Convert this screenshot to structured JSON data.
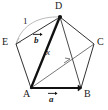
{
  "figure": {
    "type": "geometry-diagram",
    "shape": "regular-pentagon",
    "background_color": "#ffffff",
    "line_color": "#1a1a1a",
    "faint_line_color": "#9a9a9a"
  },
  "vertices": [
    {
      "name": "A",
      "label": "A",
      "x": 31,
      "y": 88,
      "label_x": 24,
      "label_y": 89
    },
    {
      "name": "B",
      "label": "B",
      "x": 81,
      "y": 88,
      "label_x": 84,
      "label_y": 89
    },
    {
      "name": "C",
      "label": "C",
      "x": 94,
      "y": 44,
      "label_x": 97,
      "label_y": 38
    },
    {
      "name": "D",
      "label": "D",
      "x": 60,
      "y": 17,
      "label_x": 56,
      "label_y": 2
    },
    {
      "name": "E",
      "label": "E",
      "x": 16,
      "y": 44,
      "label_x": 4,
      "label_y": 38
    }
  ],
  "edges": [
    {
      "from": "A",
      "to": "B",
      "style": "bold-vector"
    },
    {
      "from": "B",
      "to": "C",
      "style": "thin"
    },
    {
      "from": "C",
      "to": "D",
      "style": "thin"
    },
    {
      "from": "D",
      "to": "E",
      "style": "thin"
    },
    {
      "from": "E",
      "to": "A",
      "style": "thin"
    }
  ],
  "diagonals": [
    {
      "from": "A",
      "to": "D",
      "style": "bold-vector"
    },
    {
      "from": "A",
      "to": "C",
      "style": "thin-arrow"
    },
    {
      "from": "D",
      "to": "B",
      "style": "thin"
    },
    {
      "from": "E",
      "to": "D",
      "style": "faint-arc"
    }
  ],
  "labels": {
    "vector_a": {
      "text": "a",
      "accent": "vector-arrow",
      "x": 50,
      "y": 96
    },
    "vector_b": {
      "text": "b",
      "accent": "vector-arrow",
      "x": 35,
      "y": 38
    },
    "length_one": {
      "text": "1",
      "x": 24,
      "y": 20
    },
    "x_label": {
      "text": "x",
      "x": 47,
      "y": 50
    }
  },
  "markers": {
    "point_d": {
      "type": "filled-dot",
      "x": 60,
      "y": 17,
      "r": 2
    }
  }
}
